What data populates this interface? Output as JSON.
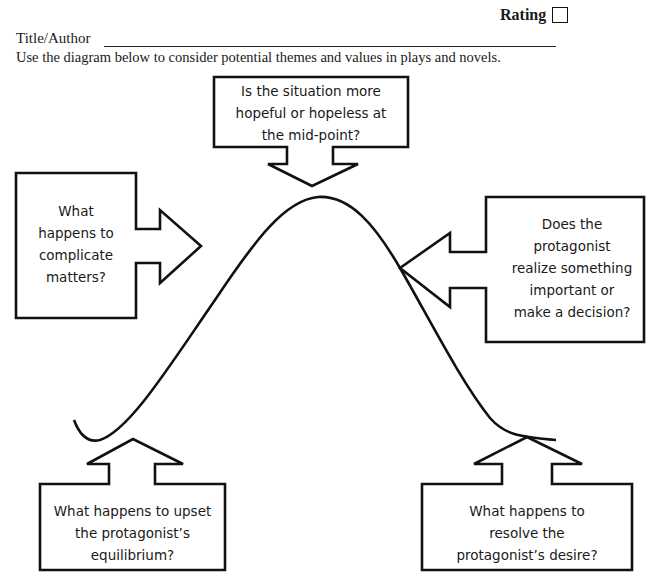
{
  "header": {
    "rating_label": "Rating",
    "title_author_label": "Title/Author",
    "instructions": "Use the diagram below to consider potential themes and values in plays and novels."
  },
  "diagram": {
    "type": "plot-arc",
    "callouts": {
      "midpoint": {
        "line1": "Is the situation more",
        "line2": "hopeful or hopeless at",
        "line3": "the mid-point?"
      },
      "complication": {
        "line1": "What",
        "line2": "happens to",
        "line3": "complicate",
        "line4": "matters?"
      },
      "realization": {
        "line1": "Does the",
        "line2": "protagonist",
        "line3": "realize something",
        "line4": "important or",
        "line5": "make a decision?"
      },
      "inciting": {
        "line1": "What happens to upset",
        "line2": "the protagonist’s",
        "line3": "equilibrium?"
      },
      "resolution": {
        "line1": "What happens to",
        "line2": "resolve the",
        "line3": "protagonist’s desire?"
      }
    },
    "stroke_color": "#111111"
  }
}
